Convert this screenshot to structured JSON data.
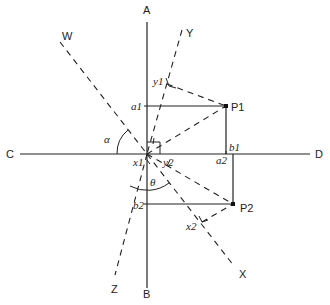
{
  "figure": {
    "title": "",
    "axes": {
      "vertical": {
        "top": "A",
        "bottom": "B"
      },
      "horizontal": {
        "left": "C",
        "right": "D"
      }
    },
    "rotated_axes": {
      "W": "W",
      "X": "X",
      "Y": "Y",
      "Z": "Z"
    },
    "points": {
      "p1": "P1",
      "p2": "P2"
    },
    "projections": {
      "a1": "a1",
      "b1": "b1",
      "a2": "a2",
      "b2": "b2",
      "x1": "x1",
      "y1": "y1",
      "x2": "x2",
      "y2": "y2"
    },
    "angles": {
      "alpha": "α",
      "theta": "θ"
    }
  }
}
